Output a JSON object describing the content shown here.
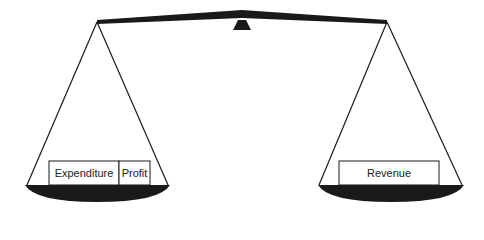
{
  "diagram": {
    "type": "balance-scale",
    "left_pan": {
      "blocks": [
        {
          "label": "Expenditure"
        },
        {
          "label": "Profit"
        }
      ]
    },
    "right_pan": {
      "blocks": [
        {
          "label": "Revenue"
        }
      ]
    },
    "colors": {
      "ink": "#1a1a1a",
      "background": "#ffffff"
    }
  }
}
